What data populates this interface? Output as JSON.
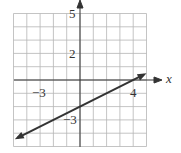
{
  "chart_data": {
    "type": "line",
    "title": "",
    "xlabel": "x",
    "ylabel": "",
    "xlim": [
      -5,
      5
    ],
    "ylim": [
      -5,
      5
    ],
    "grid": true,
    "tick_labels": {
      "x": [
        {
          "value": -3,
          "label": "−3"
        },
        {
          "value": 4,
          "label": "4"
        }
      ],
      "y": [
        {
          "value": 5,
          "label": "5"
        },
        {
          "value": 2,
          "label": "2"
        },
        {
          "value": -3,
          "label": "−3"
        }
      ]
    },
    "series": [
      {
        "name": "line",
        "equation": "y = 0.5x - 2",
        "x": [
          -4.7,
          4.8
        ],
        "y": [
          -4.35,
          0.4
        ],
        "arrows": "both"
      }
    ]
  },
  "labels": {
    "x_axis": "x",
    "y5": "5",
    "y2": "2",
    "yneg3": "−3",
    "xneg3": "−3",
    "x4": "4"
  }
}
